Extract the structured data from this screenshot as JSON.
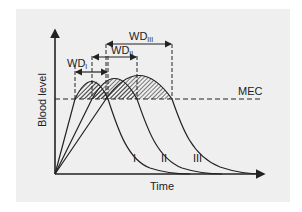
{
  "diagram": {
    "y_axis_label": "Blood level",
    "x_axis_label": "Time",
    "threshold_label": "MEC",
    "curve_labels": [
      "I",
      "II",
      "III"
    ],
    "windows": [
      {
        "base": "WD",
        "sub": "I"
      },
      {
        "base": "WD",
        "sub": "II"
      },
      {
        "base": "WD",
        "sub": "III"
      }
    ],
    "colors": {
      "background_panel": "#efefef",
      "line": "#222222",
      "hatch": "#333333"
    }
  }
}
